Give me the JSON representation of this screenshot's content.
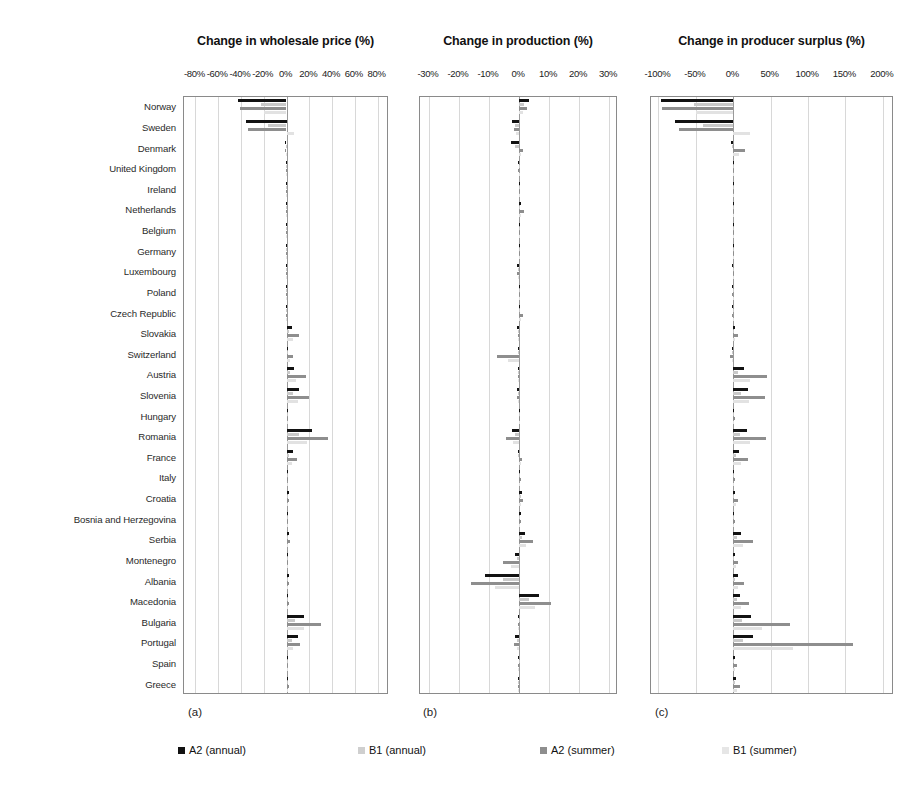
{
  "figure": {
    "panel_captions": [
      "(a)",
      "(b)",
      "(c)"
    ]
  },
  "legend": {
    "position": "bottom",
    "items": [
      {
        "label": "A2 (annual)",
        "color": "#121212"
      },
      {
        "label": "B1 (annual)",
        "color": "#cfcfcf"
      },
      {
        "label": "A2 (summer)",
        "color": "#8e8e8e"
      },
      {
        "label": "B1 (summer)",
        "color": "#e6e6e6"
      }
    ]
  },
  "chart_data": [
    {
      "type": "bar",
      "orientation": "horizontal",
      "title": "Change in wholesale price (%)",
      "xlabel": "",
      "ylabel": "",
      "xlim": [
        -90,
        90
      ],
      "xticks": [
        -80,
        -60,
        -40,
        -20,
        0,
        20,
        40,
        60,
        80
      ],
      "xticklabels": [
        "-80%",
        "-60%",
        "-40%",
        "-20%",
        "0%",
        "20%",
        "40%",
        "60%",
        "80%"
      ],
      "grid": true,
      "categories": [
        "Norway",
        "Sweden",
        "Denmark",
        "United Kingdom",
        "Ireland",
        "Netherlands",
        "Belgium",
        "Germany",
        "Luxembourg",
        "Poland",
        "Czech Republic",
        "Slovakia",
        "Switzerland",
        "Austria",
        "Slovenia",
        "Hungary",
        "Romania",
        "France",
        "Italy",
        "Croatia",
        "Bosnia and Herzegovina",
        "Serbia",
        "Montenegro",
        "Albania",
        "Macedonia",
        "Bulgaria",
        "Portugal",
        "Spain",
        "Greece"
      ],
      "series": [
        {
          "name": "A2 (annual)",
          "values": [
            -43.0,
            -36.0,
            -1.2,
            -0.3,
            -0.2,
            -0.3,
            -0.3,
            -0.4,
            -0.5,
            -0.6,
            -0.8,
            4.5,
            1.5,
            7.0,
            11.0,
            0.8,
            22.0,
            5.5,
            0.6,
            1.8,
            1.0,
            2.2,
            1.2,
            1.8,
            1.6,
            15.0,
            10.0,
            0.5,
            1.5
          ]
        },
        {
          "name": "B1 (annual)",
          "values": [
            -22.0,
            -16.0,
            -0.6,
            -0.2,
            -0.1,
            -0.2,
            -0.2,
            -0.2,
            -0.3,
            -0.3,
            -0.4,
            2.3,
            0.8,
            3.5,
            5.5,
            0.4,
            11.0,
            2.6,
            0.3,
            0.9,
            0.5,
            1.1,
            0.6,
            0.9,
            0.8,
            7.5,
            5.0,
            0.3,
            0.8
          ]
        },
        {
          "name": "A2 (summer)",
          "values": [
            -41.0,
            -34.0,
            -1.0,
            -0.3,
            -0.2,
            -0.3,
            -0.3,
            -0.4,
            -0.4,
            -0.5,
            -0.7,
            11.0,
            5.5,
            17.0,
            20.0,
            1.0,
            36.0,
            9.0,
            0.8,
            2.5,
            1.2,
            3.0,
            1.5,
            2.3,
            2.0,
            30.0,
            12.0,
            0.6,
            2.0
          ]
        },
        {
          "name": "B1 (summer)",
          "values": [
            -20.0,
            7.0,
            -0.5,
            -0.1,
            -0.1,
            -0.1,
            -0.1,
            -0.2,
            -0.2,
            -0.3,
            -0.3,
            5.5,
            2.8,
            8.5,
            10.0,
            0.5,
            18.0,
            4.5,
            0.4,
            1.2,
            0.6,
            1.5,
            0.8,
            1.1,
            1.0,
            15.0,
            6.0,
            0.3,
            1.0
          ]
        }
      ]
    },
    {
      "type": "bar",
      "orientation": "horizontal",
      "title": "Change in production (%)",
      "xlabel": "",
      "ylabel": "",
      "xlim": [
        -33,
        33
      ],
      "xticks": [
        -30,
        -20,
        -10,
        0,
        10,
        20,
        30
      ],
      "xticklabels": [
        "-30%",
        "-20%",
        "-10%",
        "0%",
        "10%",
        "20%",
        "30%"
      ],
      "grid": true,
      "categories": [
        "Norway",
        "Sweden",
        "Denmark",
        "United Kingdom",
        "Ireland",
        "Netherlands",
        "Belgium",
        "Germany",
        "Luxembourg",
        "Poland",
        "Czech Republic",
        "Slovakia",
        "Switzerland",
        "Austria",
        "Slovenia",
        "Hungary",
        "Romania",
        "France",
        "Italy",
        "Croatia",
        "Bosnia and Herzegovina",
        "Serbia",
        "Montenegro",
        "Albania",
        "Macedonia",
        "Bulgaria",
        "Portugal",
        "Spain",
        "Greece"
      ],
      "series": [
        {
          "name": "A2 (annual)",
          "values": [
            3.2,
            -2.4,
            -2.6,
            -0.2,
            -0.1,
            0.5,
            0.2,
            0.3,
            -0.8,
            0.2,
            0.3,
            -0.6,
            -0.5,
            -0.4,
            -0.6,
            0.2,
            -2.3,
            -0.5,
            0.4,
            1.0,
            0.6,
            2.0,
            -1.4,
            -11.5,
            6.5,
            -0.2,
            -1.2,
            -0.2,
            -0.3
          ]
        },
        {
          "name": "B1 (annual)",
          "values": [
            1.6,
            -1.2,
            -1.3,
            -0.1,
            -0.1,
            0.2,
            0.1,
            0.2,
            -0.4,
            0.1,
            0.2,
            -0.3,
            -0.3,
            -0.2,
            -0.3,
            0.1,
            -1.2,
            -0.3,
            0.2,
            0.5,
            0.3,
            1.0,
            -0.7,
            -5.5,
            3.2,
            -0.1,
            -0.6,
            -0.1,
            -0.2
          ]
        },
        {
          "name": "A2 (summer)",
          "values": [
            2.6,
            -1.8,
            1.4,
            -0.2,
            -0.1,
            1.5,
            0.3,
            0.4,
            -0.6,
            0.3,
            1.2,
            -0.5,
            -7.5,
            -0.5,
            -0.8,
            0.4,
            -4.2,
            1.0,
            0.6,
            1.4,
            0.8,
            4.6,
            -5.2,
            -16.0,
            10.5,
            -0.3,
            -1.6,
            -0.3,
            -0.4
          ]
        },
        {
          "name": "B1 (summer)",
          "values": [
            1.3,
            -0.9,
            0.7,
            -0.1,
            -0.1,
            0.7,
            0.2,
            0.2,
            -0.3,
            0.2,
            0.6,
            -0.3,
            -3.6,
            -0.3,
            -0.4,
            0.2,
            -2.1,
            0.5,
            0.3,
            0.7,
            0.4,
            2.3,
            -2.6,
            -8.0,
            5.2,
            -0.2,
            -0.8,
            -0.2,
            -0.2
          ]
        }
      ]
    },
    {
      "type": "bar",
      "orientation": "horizontal",
      "title": "Change in producer surplus (%)",
      "xlabel": "",
      "ylabel": "",
      "xlim": [
        -110,
        215
      ],
      "xticks": [
        -100,
        -50,
        0,
        50,
        100,
        150,
        200
      ],
      "xticklabels": [
        "-100%",
        "-50%",
        "0%",
        "50%",
        "100%",
        "150%",
        "200%"
      ],
      "grid": true,
      "categories": [
        "Norway",
        "Sweden",
        "Denmark",
        "United Kingdom",
        "Ireland",
        "Netherlands",
        "Belgium",
        "Germany",
        "Luxembourg",
        "Poland",
        "Czech Republic",
        "Slovakia",
        "Switzerland",
        "Austria",
        "Slovenia",
        "Hungary",
        "Romania",
        "France",
        "Italy",
        "Croatia",
        "Bosnia and Herzegovina",
        "Serbia",
        "Montenegro",
        "Albania",
        "Macedonia",
        "Bulgaria",
        "Portugal",
        "Spain",
        "Greece"
      ],
      "series": [
        {
          "name": "A2 (annual)",
          "values": [
            -97.0,
            -78.0,
            -3.0,
            -0.5,
            -0.3,
            -0.6,
            -0.5,
            -0.8,
            -1.0,
            -1.2,
            -1.5,
            2.0,
            -2.0,
            14.0,
            20.0,
            1.5,
            18.0,
            8.0,
            1.0,
            3.0,
            1.5,
            11.0,
            3.0,
            6.0,
            9.0,
            24.0,
            26.0,
            2.0,
            4.0,
            5.0
          ]
        },
        {
          "name": "B1 (annual)",
          "values": [
            -52.0,
            -40.0,
            -1.5,
            -0.3,
            -0.2,
            -0.3,
            -0.3,
            -0.4,
            -0.5,
            -0.6,
            -0.8,
            1.0,
            -1.0,
            7.0,
            10.0,
            0.8,
            9.0,
            4.0,
            0.5,
            1.5,
            0.8,
            5.5,
            1.5,
            3.0,
            4.5,
            12.0,
            13.0,
            1.0,
            2.0
          ]
        },
        {
          "name": "A2 (summer)",
          "values": [
            -95.0,
            -72.0,
            16.0,
            -0.4,
            -0.3,
            -0.5,
            -0.4,
            -0.7,
            -0.9,
            -1.0,
            -1.3,
            6.0,
            -4.0,
            45.0,
            42.0,
            3.0,
            44.0,
            20.0,
            2.0,
            7.0,
            3.0,
            26.0,
            7.0,
            14.0,
            21.0,
            76.0,
            160.0,
            5.0,
            9.0
          ]
        },
        {
          "name": "B1 (summer)",
          "values": [
            -50.0,
            22.0,
            8.0,
            -0.2,
            -0.1,
            -0.2,
            -0.2,
            -0.3,
            -0.4,
            -0.5,
            -0.6,
            3.0,
            -2.0,
            22.0,
            21.0,
            1.5,
            22.0,
            10.0,
            1.0,
            3.5,
            1.5,
            13.0,
            3.5,
            7.0,
            10.0,
            38.0,
            80.0,
            2.5,
            4.5
          ]
        }
      ]
    }
  ]
}
